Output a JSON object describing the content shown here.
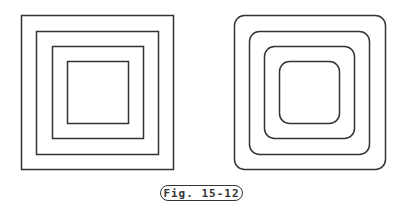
{
  "figure": {
    "caption": "Fig. 15-12",
    "stroke_color": "#333333",
    "left_panel": {
      "style": "sharp-corner concentric squares",
      "squares": [
        {
          "x": 21,
          "y": 15,
          "w": 152,
          "h": 154,
          "r": 0
        },
        {
          "x": 36,
          "y": 31,
          "w": 122,
          "h": 123,
          "r": 0
        },
        {
          "x": 52,
          "y": 46,
          "w": 91,
          "h": 92,
          "r": 0
        },
        {
          "x": 67,
          "y": 61,
          "w": 61,
          "h": 62,
          "r": 0
        }
      ]
    },
    "right_panel": {
      "style": "rounded-corner concentric squares",
      "squares": [
        {
          "x": 234,
          "y": 15,
          "w": 151,
          "h": 154,
          "r": 10
        },
        {
          "x": 249,
          "y": 31,
          "w": 120,
          "h": 123,
          "r": 10
        },
        {
          "x": 264,
          "y": 46,
          "w": 90,
          "h": 92,
          "r": 10
        },
        {
          "x": 279,
          "y": 61,
          "w": 60,
          "h": 62,
          "r": 10
        }
      ]
    }
  }
}
